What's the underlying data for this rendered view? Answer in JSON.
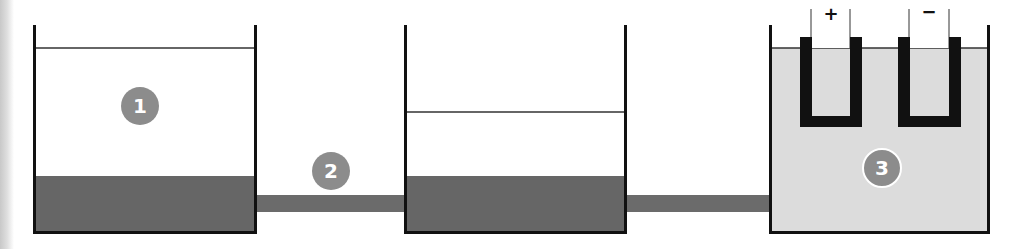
{
  "diagram": {
    "colors": {
      "wall": "#111111",
      "sediment": "#666666",
      "pipe": "#6b6b6b",
      "electrolyte": "#dcdcdc",
      "badge": "#8c8c8c",
      "water_line": "#333333"
    },
    "tanks": [
      {
        "id": "tank-1",
        "label": "1",
        "contents": "water-with-sediment"
      },
      {
        "id": "tank-2",
        "label": "",
        "contents": "water-with-sediment"
      },
      {
        "id": "tank-3",
        "label": "3",
        "contents": "electrolyte-with-electrodes"
      }
    ],
    "pipes": [
      {
        "id": "pipe-1",
        "label": "2"
      },
      {
        "id": "pipe-2",
        "label": ""
      }
    ],
    "badges": {
      "one": "1",
      "two": "2",
      "three": "3"
    },
    "electrodes": {
      "positive": "+",
      "negative": "−"
    }
  }
}
